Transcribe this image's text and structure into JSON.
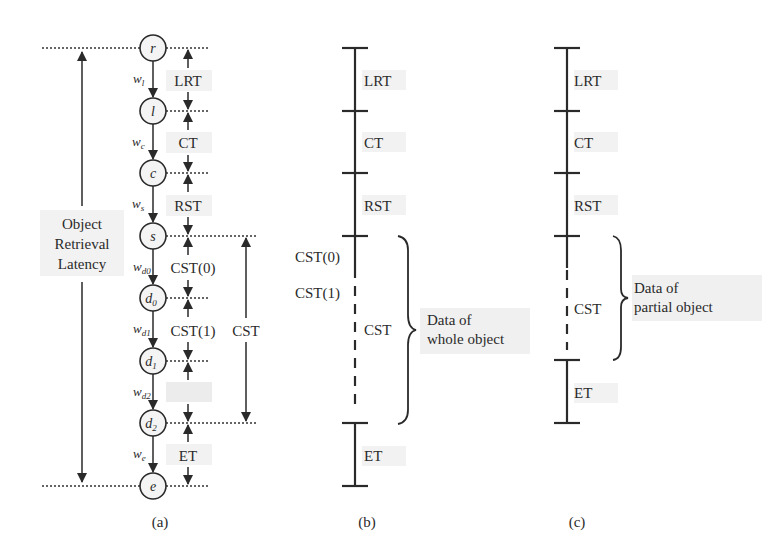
{
  "figure": {
    "panels": {
      "a": {
        "caption": "(a)",
        "nodes": [
          "r",
          "l",
          "c",
          "s",
          "d",
          "d",
          "d",
          "e"
        ],
        "node_subscripts": [
          "",
          "",
          "",
          "",
          "0",
          "1",
          "2",
          ""
        ],
        "edges": [
          {
            "w": "w",
            "sub": "l"
          },
          {
            "w": "w",
            "sub": "c"
          },
          {
            "w": "w",
            "sub": "s"
          },
          {
            "w": "w",
            "sub": "d0"
          },
          {
            "w": "w",
            "sub": "d1"
          },
          {
            "w": "w",
            "sub": "d2"
          },
          {
            "w": "w",
            "sub": "e"
          }
        ],
        "intervals": [
          "LRT",
          "CT",
          "RST",
          "CST(0)",
          "CST(1)",
          "",
          "ET"
        ],
        "cst_label": "CST",
        "total_label_lines": [
          "Object",
          "Retrieval",
          "Latency"
        ]
      },
      "b": {
        "caption": "(b)",
        "segments": [
          "LRT",
          "CT",
          "RST"
        ],
        "cst_sub_labels": [
          "CST(0)",
          "CST(1)"
        ],
        "cst_label": "CST",
        "et_label": "ET",
        "brace_label_lines": [
          "Data of",
          "whole object"
        ]
      },
      "c": {
        "caption": "(c)",
        "segments": [
          "LRT",
          "CT",
          "RST"
        ],
        "cst_label": "CST",
        "et_label": "ET",
        "brace_label_lines": [
          "Data of",
          "partial object"
        ]
      }
    }
  }
}
